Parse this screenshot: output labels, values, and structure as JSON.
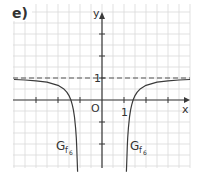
{
  "figure": {
    "panel_label": "e)",
    "x_axis_label": "x",
    "y_axis_label": "y",
    "origin_label": "O",
    "x_unit_label": "1",
    "y_unit_label": "1",
    "curve_label_main": "G",
    "curve_label_sub": "f",
    "curve_label_subsub": "6"
  },
  "colors": {
    "grid": "#d9d9d9",
    "axis": "#3a3a3a",
    "curve": "#3a3a3a",
    "asymptote": "#555555",
    "text": "#333333"
  },
  "chart_data": {
    "type": "line",
    "title": "e)",
    "xlabel": "x",
    "ylabel": "y",
    "function": "f6(x) = 1 - 1/(x^2 - 1)",
    "xlim": [
      -4,
      4
    ],
    "ylim": [
      -3.3,
      4.5
    ],
    "grid": true,
    "grid_step": 0.5,
    "x_ticks": [
      -3,
      -2,
      -1,
      1,
      2,
      3
    ],
    "y_ticks": [
      -2,
      -1,
      1,
      2,
      3
    ],
    "labeled_ticks": {
      "x": [
        1
      ],
      "y": [
        1
      ]
    },
    "horizontal_asymptote": {
      "y": 1,
      "style": "dashed"
    },
    "legend": "none",
    "annotations": [
      {
        "text": "G_f6",
        "x": -1.9,
        "y": -2.2
      },
      {
        "text": "G_f6",
        "x": 1.5,
        "y": -2.2
      },
      {
        "text": "O",
        "x": -0.3,
        "y": -0.3
      },
      {
        "text": "1",
        "x": 1,
        "y": -0.3
      },
      {
        "text": "1",
        "x": -0.1,
        "y": 1
      }
    ],
    "series": [
      {
        "name": "G_f6 (left branch)",
        "x": [
          -4,
          -3.5,
          -3,
          -2.5,
          -2,
          -1.75,
          -1.6,
          -1.5,
          -1.414,
          -1.35,
          -1.3,
          -1.25,
          -1.2,
          -1.17,
          -1.15,
          -1.13,
          -1.11
        ],
        "y": [
          0.933,
          0.911,
          0.875,
          0.81,
          0.667,
          0.515,
          0.359,
          0.2,
          0.0,
          -0.219,
          -0.449,
          -0.778,
          -1.273,
          -1.712,
          -2.101,
          -2.631,
          -3.265
        ]
      },
      {
        "name": "G_f6 (right branch)",
        "x": [
          4,
          3.5,
          3,
          2.5,
          2,
          1.75,
          1.6,
          1.5,
          1.414,
          1.35,
          1.3,
          1.25,
          1.2,
          1.17,
          1.15,
          1.13,
          1.11
        ],
        "y": [
          0.933,
          0.911,
          0.875,
          0.81,
          0.667,
          0.515,
          0.359,
          0.2,
          0.0,
          -0.219,
          -0.449,
          -0.778,
          -1.273,
          -1.712,
          -2.101,
          -2.631,
          -3.265
        ]
      }
    ]
  }
}
